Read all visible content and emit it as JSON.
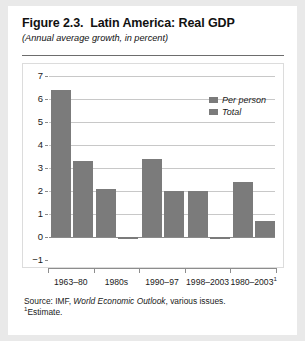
{
  "figure": {
    "title": "Figure 2.3.  Latin America: Real GDP",
    "subtitle": "(Annual average growth, in percent)",
    "source_prefix": "Source: IMF, ",
    "source_italic": "World Economic Outlook",
    "source_suffix": ", various issues.",
    "footnote_marker": "1",
    "footnote_text": "Estimate."
  },
  "chart_data": {
    "type": "bar",
    "title": "Figure 2.3.  Latin America: Real GDP",
    "subtitle": "(Annual average growth, in percent)",
    "xlabel": "",
    "ylabel": "",
    "ylim": [
      -1,
      7
    ],
    "yticks": [
      7,
      6,
      5,
      4,
      3,
      2,
      1,
      0,
      -1
    ],
    "ytick_labels": [
      "7",
      "6",
      "5",
      "4",
      "3",
      "2",
      "1",
      "0",
      "−1"
    ],
    "grid": true,
    "legend_position": "top-right",
    "categories": [
      "1963–80",
      "1980s",
      "1990–97",
      "1998–2003",
      "1980–2003"
    ],
    "category_footnote_index": 4,
    "series": [
      {
        "name": "Total",
        "values": [
          6.4,
          2.1,
          3.4,
          2.0,
          2.4
        ],
        "color": "#7b7b7b"
      },
      {
        "name": "Per person",
        "values": [
          3.3,
          -0.1,
          2.0,
          -0.1,
          0.7
        ],
        "color": "#7b7b7b"
      }
    ],
    "legend_entries": [
      "Per person",
      "Total"
    ],
    "bar_color": "#7b7b7b",
    "gridline_color": "#c8c8c8",
    "axis_color": "#8a8a8a"
  }
}
